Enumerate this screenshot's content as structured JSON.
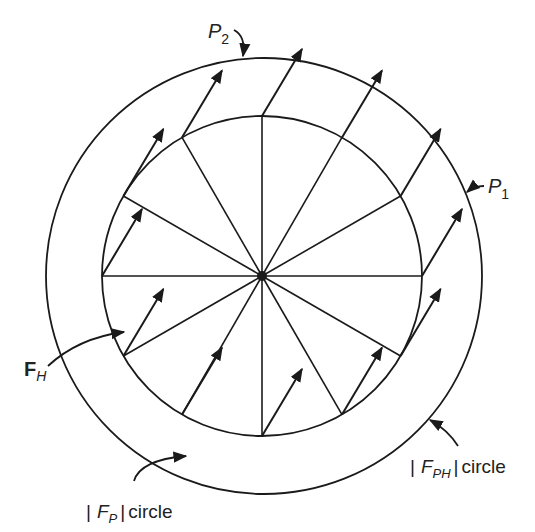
{
  "diagram": {
    "type": "vector-field-circle",
    "center": {
      "x": 262,
      "y": 276
    },
    "inner_circle": {
      "name": "|F_P| circle",
      "radius": 160
    },
    "outer_circle": {
      "name": "|F_PH| circle",
      "radius": 218,
      "cx_offset": 2
    },
    "spokes": {
      "count": 12,
      "step_deg": 30
    },
    "constant_vector": {
      "name": "F_H",
      "dx": 40,
      "dy": -67
    },
    "colors": {
      "stroke": "#1a1a1a",
      "background": "#ffffff"
    }
  },
  "labels": {
    "p2": {
      "main": "P",
      "sub": "2"
    },
    "p1": {
      "main": "P",
      "sub": "1"
    },
    "fh": {
      "main": "F",
      "sub": "H"
    },
    "fph_circle": {
      "bar": "|",
      "main": "F",
      "sub": "PH",
      "bar2": "|",
      "suffix": "circle"
    },
    "fp_circle": {
      "bar": "|",
      "main": "F",
      "sub": "P",
      "bar2": "|",
      "suffix": "circle"
    }
  }
}
